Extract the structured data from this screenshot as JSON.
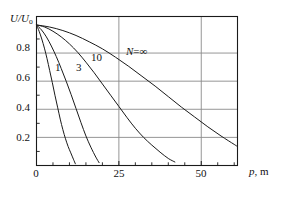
{
  "chart_data": {
    "type": "line",
    "title": "",
    "subtitle": "",
    "xlabel": "p, m",
    "ylabel": "U/U₀",
    "xlim": [
      0,
      61
    ],
    "ylim": [
      0,
      1.06
    ],
    "grid": true,
    "grid_x_values": [
      25,
      50
    ],
    "grid_y_values": [
      0.2,
      0.4,
      0.6,
      0.8
    ],
    "xticks": [
      0,
      25,
      50
    ],
    "xtick_labels": [
      "0",
      "25",
      "50"
    ],
    "xminor_step": 5,
    "yticks": [
      0.2,
      0.4,
      0.6,
      0.8
    ],
    "ytick_labels": [
      "0.2",
      "0.4",
      "0.6",
      "0.8"
    ],
    "yminor": [
      0.1,
      0.3,
      0.5,
      0.7,
      0.9
    ],
    "legend_position": "inline-annotations",
    "line_color": "#1a1a1a",
    "grid_color": "#8a8a8a",
    "axis_color": "#1a1a1a",
    "series": [
      {
        "name": "1",
        "label": "1",
        "label_x": 6.5,
        "label_y": 0.655,
        "x": [
          0,
          0.8,
          1.6,
          2.4,
          3.2,
          4.0,
          4.8,
          5.6,
          6.4,
          7.2,
          8.0,
          8.8,
          9.6,
          10.4,
          11.2,
          11.8
        ],
        "y": [
          1.0,
          0.955,
          0.9,
          0.835,
          0.76,
          0.675,
          0.59,
          0.5,
          0.415,
          0.33,
          0.255,
          0.19,
          0.135,
          0.09,
          0.045,
          0.012
        ]
      },
      {
        "name": "3",
        "label": "3",
        "label_x": 12.8,
        "label_y": 0.655,
        "x": [
          0,
          1.5,
          3.0,
          4.5,
          6.0,
          7.5,
          9.0,
          10.5,
          12.0,
          13.5,
          15.0,
          16.5,
          18.0,
          19.0
        ],
        "y": [
          1.0,
          0.965,
          0.915,
          0.85,
          0.775,
          0.69,
          0.6,
          0.505,
          0.405,
          0.305,
          0.21,
          0.13,
          0.06,
          0.02
        ]
      },
      {
        "name": "10",
        "label": "10",
        "label_x": 18.2,
        "label_y": 0.735,
        "x": [
          0,
          2.5,
          5.0,
          7.5,
          10.0,
          12.5,
          15.0,
          17.5,
          20.0,
          22.5,
          25.0,
          27.5,
          30.0,
          32.5,
          35.0,
          37.5,
          40.0,
          42.0
        ],
        "y": [
          1.0,
          0.985,
          0.955,
          0.915,
          0.865,
          0.805,
          0.735,
          0.66,
          0.58,
          0.5,
          0.42,
          0.34,
          0.265,
          0.2,
          0.145,
          0.095,
          0.05,
          0.025
        ]
      },
      {
        "name": "∞",
        "label": "N = ∞",
        "label_x": 28.5,
        "label_y": 0.79,
        "x": [
          0,
          4,
          8,
          12,
          16,
          20,
          24,
          28,
          32,
          36,
          40,
          44,
          48,
          52,
          56,
          60,
          61
        ],
        "y": [
          1.0,
          0.985,
          0.96,
          0.925,
          0.88,
          0.83,
          0.77,
          0.705,
          0.635,
          0.565,
          0.49,
          0.415,
          0.345,
          0.275,
          0.21,
          0.15,
          0.135
        ]
      }
    ]
  },
  "labels": {
    "y_axis": "U/U",
    "y_axis_sub": "o",
    "x_axis_var": "p",
    "x_axis_unit": ", m",
    "n_symbol": "N",
    "n_eq": "=",
    "n_value": "∞",
    "curve_1": "1",
    "curve_3": "3",
    "curve_10": "10",
    "tick_y_08": "0.8",
    "tick_y_06": "0.6",
    "tick_y_04": "0.4",
    "tick_y_02": "0.2",
    "tick_x_0": "0",
    "tick_x_25": "25",
    "tick_x_50": "50"
  }
}
